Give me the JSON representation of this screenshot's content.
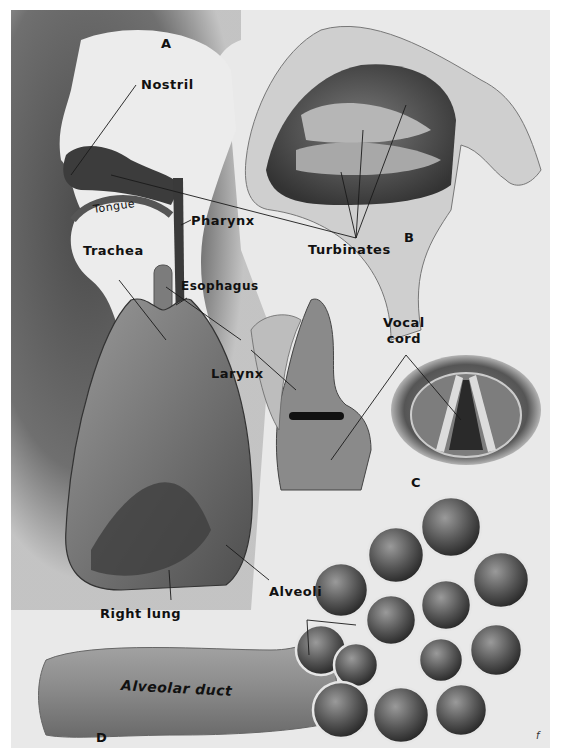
{
  "figure": {
    "panels": [
      {
        "id": "A",
        "label": "A",
        "subject": "sagittal head and thorax outline"
      },
      {
        "id": "B",
        "label": "B",
        "subject": "nasal cavity cross-section"
      },
      {
        "id": "C",
        "label": "C",
        "subject": "larynx and vocal cords"
      },
      {
        "id": "D",
        "label": "D",
        "subject": "alveolar duct and alveoli"
      }
    ],
    "labels": {
      "nostril": "Nostril",
      "tongue": "Tongue",
      "pharynx": "Pharynx",
      "trachea": "Trachea",
      "esophagus": "Esophagus",
      "turbinates": "Turbinates",
      "larynx": "Larynx",
      "vocal_cord": "Vocal\ncord",
      "vocal_cord_line1": "Vocal",
      "vocal_cord_line2": "cord",
      "alveoli": "Alveoli",
      "right_lung": "Right lung",
      "alveolar_duct": "Alveolar duct"
    },
    "signature": "f",
    "colors": {
      "background": "#e9e9e9",
      "dark_shadow": "#3a3a3a",
      "tissue": "#6e6e6e",
      "label_text": "#111111",
      "leader_line": "#1a1a1a"
    }
  }
}
